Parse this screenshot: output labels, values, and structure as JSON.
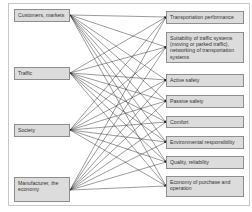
{
  "diagram": {
    "type": "bipartite-relationship",
    "left_nodes": [
      {
        "id": "customers",
        "label": "Customers, markets"
      },
      {
        "id": "traffic",
        "label": "Traffic"
      },
      {
        "id": "society",
        "label": "Society"
      },
      {
        "id": "manufacturer",
        "label": "Manufacturer, the economy"
      }
    ],
    "right_nodes": [
      {
        "id": "transport",
        "label": "Transportation performance"
      },
      {
        "id": "suitability",
        "label": "Suitability of traffic systems (moving or parked traffic), networking of transportation systems"
      },
      {
        "id": "active",
        "label": "Active safety"
      },
      {
        "id": "passive",
        "label": "Passive safety"
      },
      {
        "id": "comfort",
        "label": "Comfort"
      },
      {
        "id": "environment",
        "label": "Environmental responsibility"
      },
      {
        "id": "quality",
        "label": "Quality, reliability"
      },
      {
        "id": "economy",
        "label": "Economy of purchase and operation"
      }
    ],
    "edges": "every left node connects to every right node (arrows point to right nodes)",
    "colors": {
      "box_fill": "#dcdcdc",
      "box_border": "#8e8e8e",
      "line": "#222222",
      "frame": "#c8c8c8"
    }
  }
}
